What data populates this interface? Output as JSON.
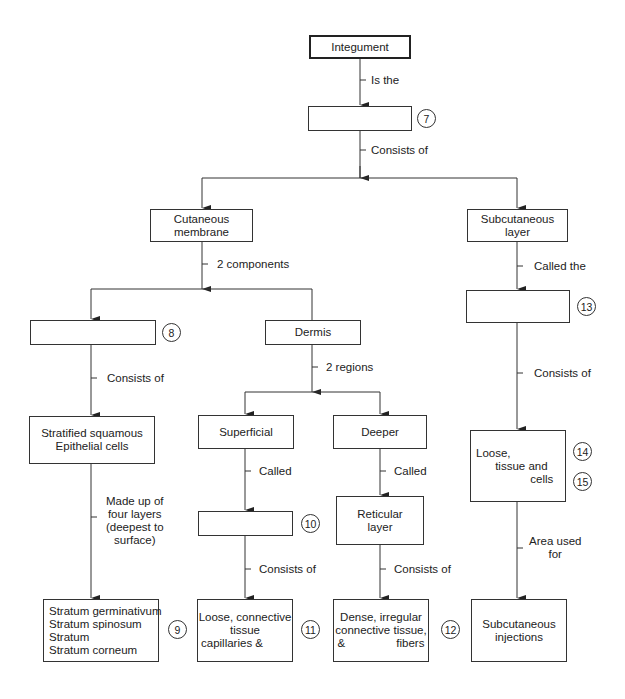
{
  "diagram": {
    "nodes": {
      "integument": {
        "lines": [
          "Integument"
        ]
      },
      "n7": {
        "lines": [
          ""
        ],
        "number": "7"
      },
      "cutaneous": {
        "lines": [
          "Cutaneous",
          "membrane"
        ]
      },
      "subcutaneous": {
        "lines": [
          "Subcutaneous",
          "layer"
        ]
      },
      "n8": {
        "lines": [
          ""
        ],
        "number": "8"
      },
      "dermis": {
        "lines": [
          "Dermis"
        ]
      },
      "n13": {
        "lines": [
          ""
        ],
        "number": "13"
      },
      "stratified": {
        "lines": [
          "Stratified squamous",
          "Epithelial cells"
        ]
      },
      "superficial": {
        "lines": [
          "Superficial"
        ]
      },
      "deeper": {
        "lines": [
          "Deeper"
        ]
      },
      "loose_tissue": {
        "lines": [
          "Loose,",
          "      tissue and",
          "                 cells"
        ],
        "numbers": [
          "14",
          "15"
        ]
      },
      "n10": {
        "lines": [
          ""
        ],
        "number": "10"
      },
      "reticular": {
        "lines": [
          "Reticular",
          "layer"
        ]
      },
      "strata": {
        "lines": [
          "Stratum germinativum",
          "Stratum spinosum",
          "Stratum",
          "Stratum corneum"
        ],
        "number": "9"
      },
      "loose_connective": {
        "lines": [
          "Loose, connective",
          "tissue",
          "capillaries &"
        ],
        "number": "11"
      },
      "dense_irregular": {
        "lines": [
          "Dense, irregular",
          "connective tissue,",
          "&                fibers"
        ],
        "number": "12"
      },
      "injections": {
        "lines": [
          "Subcutaneous",
          "injections"
        ]
      }
    },
    "edge_labels": {
      "is_the": "Is the",
      "consists_of_top": "Consists of",
      "two_components": "2 components",
      "called_the": "Called the",
      "consists_of_left": "Consists of",
      "two_regions": "2 regions",
      "consists_of_right": "Consists of",
      "made_up_of": "Made up of\nfour layers\n(deepest to\nsurface)",
      "called_superficial": "Called",
      "called_deeper": "Called",
      "area_used_for": "Area used\nfor",
      "consists_of_10": "Consists of",
      "consists_of_reticular": "Consists of"
    },
    "colors": {
      "line": "#333333",
      "background": "#ffffff",
      "text": "#222222"
    }
  }
}
